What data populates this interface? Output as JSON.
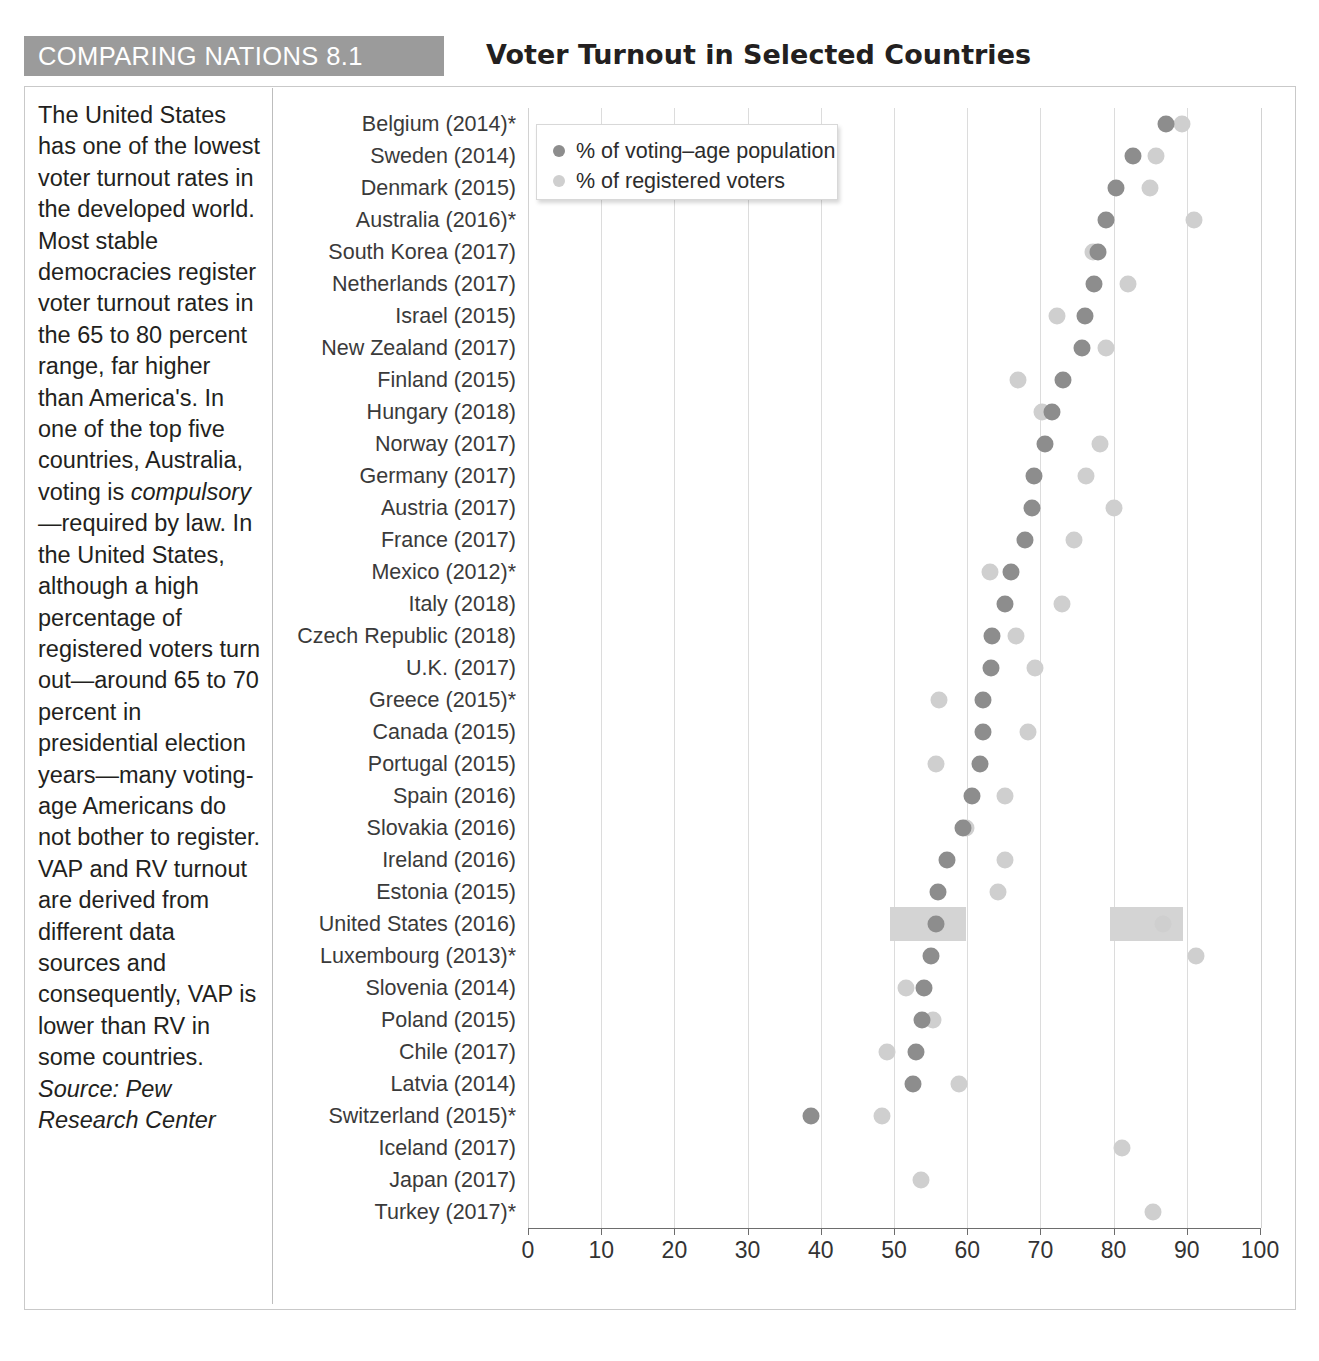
{
  "header": {
    "tag": "COMPARING NATIONS 8.1",
    "title": "Voter Turnout in Selected Countries"
  },
  "note": {
    "paragraph": "The United States has one of the lowest voter turnout rates in the developed world. Most stable democracies register voter turnout rates in the 65 to 80 percent range, far higher than America's. In one of the top five countries, Australia, voting is ",
    "italic_word": "compulsory",
    "paragraph2": "—required by law. In the United States, although a high percentage of registered voters turn out—around 65 to 70 percent in presidential election years—many voting-age Americans do not bother to register. VAP and RV turnout are derived from different data sources and consequently, VAP is lower than RV in some countries. ",
    "source": "Source: Pew Research Center"
  },
  "legend": {
    "position": "top-left-inside-plot",
    "entries": [
      {
        "label": "% of voting–age population",
        "color": "#8d8d8d",
        "key": "vap"
      },
      {
        "label": "% of registered voters",
        "color": "#cfcfcf",
        "key": "rv"
      }
    ]
  },
  "chart_data": {
    "type": "scatter",
    "title": "Voter Turnout in Selected Countries",
    "xlabel": "",
    "ylabel": "",
    "xlim": [
      0,
      100
    ],
    "xticks": [
      0,
      10,
      20,
      30,
      40,
      50,
      60,
      70,
      80,
      90,
      100
    ],
    "grid": "vertical",
    "highlight_row": "United States (2016)",
    "highlight_color": "#d4d4d4",
    "series": [
      {
        "name": "% of voting–age population",
        "key": "vap",
        "color": "#8d8d8d"
      },
      {
        "name": "% of registered voters",
        "key": "rv",
        "color": "#cfcfcf"
      }
    ],
    "categories": [
      "Belgium (2014)*",
      "Sweden (2014)",
      "Denmark (2015)",
      "Australia (2016)*",
      "South Korea (2017)",
      "Netherlands (2017)",
      "Israel (2015)",
      "New Zealand (2017)",
      "Finland (2015)",
      "Hungary (2018)",
      "Norway (2017)",
      "Germany (2017)",
      "Austria (2017)",
      "France (2017)",
      "Mexico (2012)*",
      "Italy (2018)",
      "Czech Republic (2018)",
      "U.K. (2017)",
      "Greece (2015)*",
      "Canada (2015)",
      "Portugal (2015)",
      "Spain (2016)",
      "Slovakia (2016)",
      "Ireland (2016)",
      "Estonia (2015)",
      "United States (2016)",
      "Luxembourg (2013)*",
      "Slovenia (2014)",
      "Poland (2015)",
      "Chile (2017)",
      "Latvia (2014)",
      "Switzerland (2015)*",
      "Iceland (2017)",
      "Japan (2017)",
      "Turkey (2017)*"
    ],
    "rows": [
      {
        "country": "Belgium (2014)*",
        "vap": 87.2,
        "rv": 89.4
      },
      {
        "country": "Sweden (2014)",
        "vap": 82.6,
        "rv": 85.8
      },
      {
        "country": "Denmark (2015)",
        "vap": 80.3,
        "rv": 85.0
      },
      {
        "country": "Australia (2016)*",
        "vap": 79.0,
        "rv": 91.0
      },
      {
        "country": "South Korea (2017)",
        "vap": 77.9,
        "rv": 77.2
      },
      {
        "country": "Netherlands (2017)",
        "vap": 77.3,
        "rv": 81.9
      },
      {
        "country": "Israel (2015)",
        "vap": 76.1,
        "rv": 72.3
      },
      {
        "country": "New Zealand (2017)",
        "vap": 75.7,
        "rv": 79.0
      },
      {
        "country": "Finland (2015)",
        "vap": 73.1,
        "rv": 66.9
      },
      {
        "country": "Hungary (2018)",
        "vap": 71.6,
        "rv": 70.2
      },
      {
        "country": "Norway (2017)",
        "vap": 70.6,
        "rv": 78.2
      },
      {
        "country": "Germany (2017)",
        "vap": 69.1,
        "rv": 76.2
      },
      {
        "country": "Austria (2017)",
        "vap": 68.9,
        "rv": 80.0
      },
      {
        "country": "France (2017)",
        "vap": 67.9,
        "rv": 74.6
      },
      {
        "country": "Mexico (2012)*",
        "vap": 66.0,
        "rv": 63.1
      },
      {
        "country": "Italy (2018)",
        "vap": 65.2,
        "rv": 73.0
      },
      {
        "country": "Czech Republic (2018)",
        "vap": 63.4,
        "rv": 66.6
      },
      {
        "country": "U.K. (2017)",
        "vap": 63.2,
        "rv": 69.3
      },
      {
        "country": "Greece (2015)*",
        "vap": 62.1,
        "rv": 56.2
      },
      {
        "country": "Canada (2015)",
        "vap": 62.1,
        "rv": 68.3
      },
      {
        "country": "Portugal (2015)",
        "vap": 61.8,
        "rv": 55.8
      },
      {
        "country": "Spain (2016)",
        "vap": 60.6,
        "rv": 65.1
      },
      {
        "country": "Slovakia (2016)",
        "vap": 59.4,
        "rv": 59.8
      },
      {
        "country": "Ireland (2016)",
        "vap": 57.3,
        "rv": 65.1
      },
      {
        "country": "Estonia (2015)",
        "vap": 56.0,
        "rv": 64.2
      },
      {
        "country": "United States (2016)",
        "vap": 55.7,
        "rv": 86.8
      },
      {
        "country": "Luxembourg (2013)*",
        "vap": 55.1,
        "rv": 91.2
      },
      {
        "country": "Slovenia (2014)",
        "vap": 54.1,
        "rv": 51.7
      },
      {
        "country": "Poland (2015)",
        "vap": 53.8,
        "rv": 55.3
      },
      {
        "country": "Chile (2017)",
        "vap": 53.0,
        "rv": 49.0
      },
      {
        "country": "Latvia (2014)",
        "vap": 52.6,
        "rv": 58.9
      },
      {
        "country": "Switzerland (2015)*",
        "vap": 38.6,
        "rv": 48.4
      },
      {
        "country": "Iceland (2017)",
        "vap": null,
        "rv": 81.2
      },
      {
        "country": "Japan (2017)",
        "vap": null,
        "rv": 53.7
      },
      {
        "country": "Turkey (2017)*",
        "vap": null,
        "rv": 85.4
      }
    ],
    "highlight_bands": [
      {
        "country": "United States (2016)",
        "from": 49.5,
        "to": 59.8
      },
      {
        "country": "United States (2016)",
        "from": 79.5,
        "to": 89.5
      }
    ]
  }
}
